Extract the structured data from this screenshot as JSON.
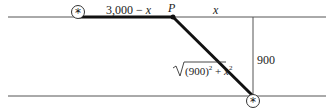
{
  "diagram": {
    "labels": {
      "left_segment": "3,000 − ",
      "left_segment_var": "x",
      "point": "P",
      "right_segment": "x",
      "vertical": "900",
      "hypotenuse_radicand_a": "(900)",
      "hypotenuse_exp_a": "2",
      "hypotenuse_plus": " + ",
      "hypotenuse_var": "x",
      "hypotenuse_exp_b": "2"
    },
    "markers": [
      "start-star",
      "end-star"
    ],
    "colors": {
      "line": "#333333",
      "path": "#111111"
    }
  }
}
